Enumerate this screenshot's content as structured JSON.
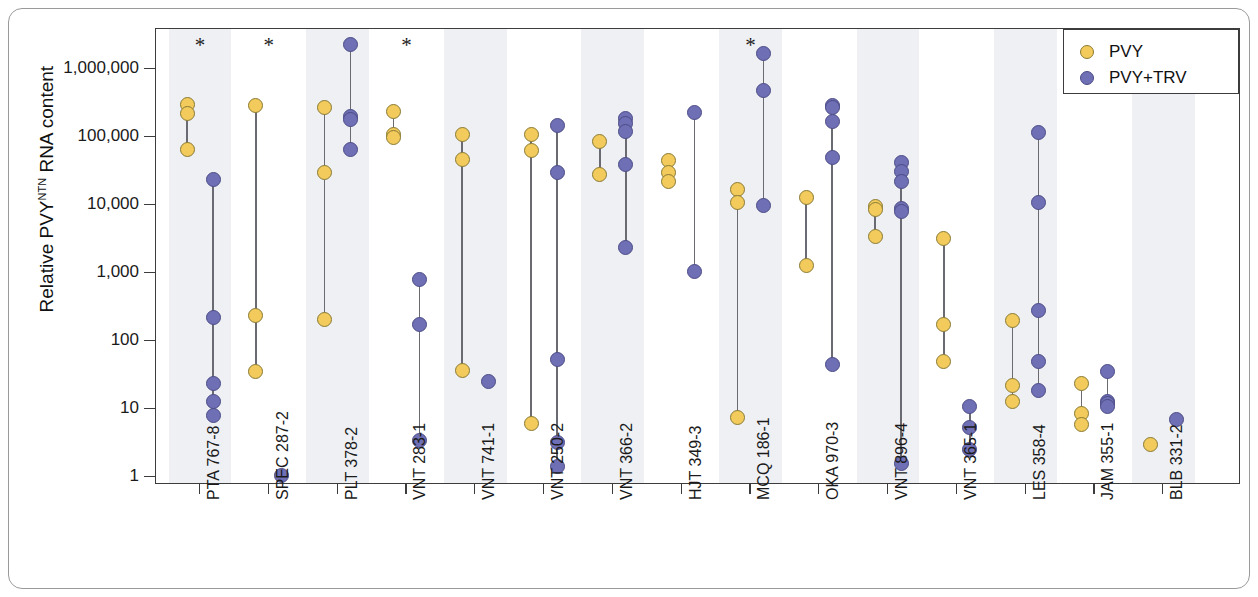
{
  "chart_data": {
    "type": "scatter",
    "title": "",
    "xlabel": "",
    "ylabel": "Relative PVY^NTN RNA content",
    "ylabel_base": "Relative PVY",
    "ylabel_sup": "NTN",
    "ylabel_tail": " RNA content",
    "yscale": "log",
    "ylim": [
      1,
      3000000
    ],
    "ytick_values": [
      1000000,
      100000,
      10000,
      1000,
      100,
      10,
      1
    ],
    "ytick_labels": [
      "1,000,000",
      "100,000",
      "10,000",
      "1,000",
      "100",
      "10",
      "1"
    ],
    "grid": false,
    "legend_position": "top-right",
    "legend": [
      {
        "name": "PVY",
        "color": "#f2cb5c"
      },
      {
        "name": "PVY+TRV",
        "color": "#6f6fb5"
      }
    ],
    "significance_marker": "*",
    "significant_categories": [
      "PTA 767-8",
      "SPEC 287-2",
      "VNT 283-1",
      "MCQ 186-1"
    ],
    "categories": [
      "PTA 767-8",
      "SPEC 287-2",
      "PLT 378-2",
      "VNT 283-1",
      "VNT 741-1",
      "VNT 250-2",
      "VNT 366-2",
      "HJT 349-3",
      "MCQ 186-1",
      "OKA 970-3",
      "VNT 896-4",
      "VNT 365-1",
      "LES 358-4",
      "JAM 355-1",
      "BLB 331-2"
    ],
    "groups": [
      {
        "category": "PTA 767-8",
        "significant": true,
        "PVY": [
          300000,
          220000,
          65000
        ],
        "PVY+TRV": [
          24000,
          220,
          24,
          13,
          8
        ]
      },
      {
        "category": "SPEC 287-2",
        "significant": true,
        "PVY": [
          290000,
          240,
          36
        ],
        "PVY+TRV": [
          1.05
        ]
      },
      {
        "category": "PLT 378-2",
        "significant": false,
        "PVY": [
          270000,
          30000,
          210
        ],
        "PVY+TRV": [
          2300000,
          200000,
          180000,
          65000
        ]
      },
      {
        "category": "VNT 283-1",
        "significant": true,
        "PVY": [
          240000,
          110000,
          100000
        ],
        "PVY+TRV": [
          790,
          175,
          3.5
        ]
      },
      {
        "category": "VNT 741-1",
        "significant": false,
        "PVY": [
          110000,
          46000,
          37
        ],
        "PVY+TRV": [
          25
        ]
      },
      {
        "category": "VNT 250-2",
        "significant": false,
        "PVY": [
          110000,
          63000,
          6.2
        ],
        "PVY+TRV": [
          150000,
          30000,
          54,
          3.2,
          1.45
        ]
      },
      {
        "category": "VNT 366-2",
        "significant": false,
        "PVY": [
          85000,
          28000
        ],
        "PVY+TRV": [
          190000,
          160000,
          120000,
          40000,
          2400
        ]
      },
      {
        "category": "HJT 349-3",
        "significant": false,
        "PVY": [
          45000,
          30000,
          22000
        ],
        "PVY+TRV": [
          230000,
          1050
        ]
      },
      {
        "category": "MCQ 186-1",
        "significant": true,
        "PVY": [
          17000,
          11000,
          7.5
        ],
        "PVY+TRV": [
          1700000,
          480000,
          10000
        ]
      },
      {
        "category": "OKA 970-3",
        "significant": false,
        "PVY": [
          13000,
          1300
        ],
        "PVY+TRV": [
          290000,
          270000,
          170000,
          50000,
          45
        ]
      },
      {
        "category": "VNT 896-4",
        "significant": false,
        "PVY": [
          9500,
          8500,
          3500
        ],
        "PVY+TRV": [
          42000,
          31000,
          22000,
          9000,
          8000,
          1.6
        ]
      },
      {
        "category": "VNT 365-1",
        "significant": false,
        "PVY": [
          3200,
          175,
          50
        ],
        "PVY+TRV": [
          11,
          5.3,
          2.5
        ]
      },
      {
        "category": "LES 358-4",
        "significant": false,
        "PVY": [
          200,
          22,
          13
        ],
        "PVY+TRV": [
          115000,
          11000,
          280,
          50,
          19
        ]
      },
      {
        "category": "JAM 355-1",
        "significant": false,
        "PVY": [
          24,
          8.5,
          6
        ],
        "PVY+TRV": [
          36,
          13,
          12,
          11
        ]
      },
      {
        "category": "BLB 331-2",
        "significant": false,
        "PVY": [
          3
        ],
        "PVY+TRV": [
          7
        ]
      }
    ]
  }
}
